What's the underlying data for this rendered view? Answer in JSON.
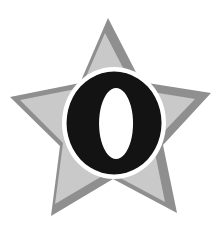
{
  "graphic": {
    "kind": "star-badge-logo",
    "description": "Five-pointed star badge with a bold letter O centered on it",
    "background_color": "#ffffff",
    "star": {
      "name": "five-pointed-star",
      "points": 5,
      "fill_color": "#c9c9c9",
      "border_color": "#8f8f8f",
      "shadow_color": "#8f8f8f",
      "outer_radius": 105,
      "inner_radius": 47,
      "center_x": 112,
      "center_y": 112,
      "rotation_deg": -4
    },
    "letter": {
      "name": "letter-o",
      "character": "O",
      "fill_color": "#131313",
      "halo_color": "#ffffff",
      "halo_width": 5,
      "center_x": 114,
      "center_y": 123,
      "outer_width": 95,
      "outer_height": 103,
      "counter_width": 34,
      "counter_height": 71
    }
  }
}
